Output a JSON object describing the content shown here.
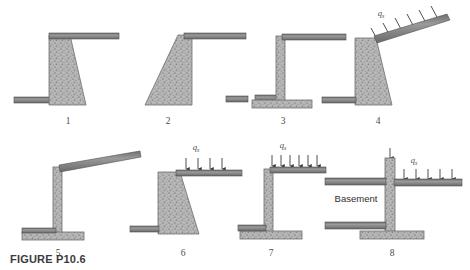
{
  "figure": {
    "caption": "FIGURE P10.6",
    "background_color": "#ffffff",
    "concrete_fill_color": "#b3b3b3",
    "concrete_edge_color": "#6e6e6e",
    "slab_color": "#8a8a8a",
    "slab_edge_color": "#4f4f4f",
    "arrow_color": "#3a3a3a",
    "text_color": "#4a4a4a"
  },
  "labels": {
    "surcharge_symbol": "q",
    "surcharge_subscript": "s",
    "basement": "Basement"
  },
  "panels": [
    {
      "number": "1",
      "description": "gravity retaining wall, vertical back face with sloping front face, level backfill slab at top right, ground line at left toe",
      "has_surcharge": false,
      "surcharge_label": "",
      "slab_orientation": "horizontal"
    },
    {
      "number": "2",
      "description": "gravity retaining wall with sloping back face and vertical front face, level slab at top right",
      "has_surcharge": false,
      "surcharge_label": "",
      "slab_orientation": "horizontal"
    },
    {
      "number": "3",
      "description": "cantilever T-shaped retaining wall with footing, level slab at top right and ground line at left",
      "has_surcharge": false,
      "surcharge_label": "",
      "slab_orientation": "horizontal"
    },
    {
      "number": "4",
      "description": "gravity retaining wall with inclined backfill slab carrying inclined surcharge load",
      "has_surcharge": true,
      "surcharge_label": "q",
      "slab_orientation": "inclined"
    },
    {
      "number": "5",
      "description": "cantilever T-shaped retaining wall with footing and inclined slab at top, no surcharge",
      "has_surcharge": false,
      "surcharge_label": "",
      "slab_orientation": "inclined"
    },
    {
      "number": "6",
      "description": "gravity retaining wall with sloping front face and level slab carrying vertical surcharge load",
      "has_surcharge": true,
      "surcharge_label": "q",
      "slab_orientation": "horizontal"
    },
    {
      "number": "7",
      "description": "cantilever T-shaped retaining wall with footing and level slab carrying vertical surcharge load",
      "has_surcharge": true,
      "surcharge_label": "q",
      "slab_orientation": "horizontal"
    },
    {
      "number": "8",
      "description": "basement wall with upper and lower floor slabs, footing, vertical surcharge on exterior grade slab",
      "has_surcharge": true,
      "surcharge_label": "q",
      "slab_orientation": "horizontal",
      "room_label": "Basement"
    }
  ]
}
